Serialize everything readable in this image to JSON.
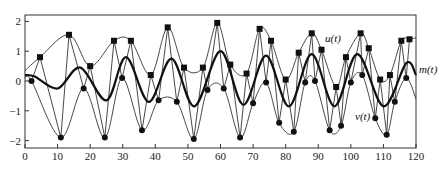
{
  "chart_data": {
    "type": "line",
    "title": "",
    "xlabel": "",
    "ylabel": "",
    "xlim": [
      0,
      120
    ],
    "ylim": [
      -2.3,
      2.2
    ],
    "x_ticks": [
      0,
      10,
      20,
      30,
      40,
      50,
      60,
      70,
      80,
      90,
      100,
      110,
      120
    ],
    "y_ticks": [
      -2,
      -1,
      0,
      1,
      2
    ],
    "grid": false,
    "legend": "inline labels",
    "annotations": [
      {
        "text": "u(t)",
        "x": 92,
        "y": 1.45
      },
      {
        "text": "m(t)",
        "x": 121,
        "y": 0.4
      },
      {
        "text": "v(t)",
        "x": 102,
        "y": -1.2
      }
    ],
    "series": [
      {
        "name": "u(t)",
        "style": "thin line, upper envelope through square markers",
        "marker": "square",
        "x": [
          0,
          4.6,
          13.5,
          20,
          27.3,
          32.5,
          38.6,
          43.8,
          48.8,
          54.6,
          59,
          63,
          68,
          72,
          75.5,
          80,
          84,
          88,
          91,
          95.5,
          98.5,
          103,
          105.5,
          109,
          112,
          115.5,
          118,
          120
        ],
        "y": [
          0.35,
          0.8,
          1.55,
          0.5,
          1.35,
          1.35,
          0.2,
          1.8,
          0.45,
          0.45,
          1.95,
          0.55,
          0.25,
          1.75,
          1.35,
          0.05,
          0.95,
          1.6,
          1.05,
          -0.2,
          0.8,
          1.6,
          1.1,
          0.05,
          0.2,
          1.35,
          1.4,
          1.45
        ]
      },
      {
        "name": "v(t)",
        "style": "thin line, lower envelope through circle markers",
        "marker": "circle",
        "x": [
          0,
          2,
          11,
          18,
          24.5,
          29.8,
          35.9,
          41,
          46.6,
          51.8,
          56,
          61,
          66,
          70,
          74,
          78,
          82.5,
          86,
          89,
          93.5,
          97,
          100,
          103.5,
          107.5,
          111,
          113.5,
          117,
          120
        ],
        "y": [
          0.1,
          0.0,
          -1.9,
          -0.25,
          -1.9,
          0.1,
          -1.65,
          -0.65,
          -0.7,
          -1.95,
          -0.3,
          -0.25,
          -1.9,
          -0.75,
          -0.05,
          -1.4,
          -1.7,
          -0.05,
          0.0,
          -1.65,
          -1.5,
          -0.05,
          0.2,
          -1.25,
          -1.8,
          -0.7,
          0.1,
          -0.6
        ]
      },
      {
        "name": "m(t)",
        "style": "thick line, local mean",
        "marker": "none",
        "x": [
          0,
          3,
          10,
          17,
          25,
          31,
          38,
          45,
          52,
          60,
          67,
          74,
          81,
          88,
          95,
          102,
          110,
          117,
          120
        ],
        "y": [
          0.2,
          0.15,
          -0.25,
          0.45,
          -0.65,
          0.8,
          -0.7,
          0.75,
          -0.85,
          1.0,
          -0.8,
          0.85,
          -0.85,
          0.9,
          -0.85,
          0.9,
          -0.85,
          0.6,
          0.2
        ]
      }
    ],
    "signal_zigzag": {
      "name": "signal extrema polyline",
      "x": [
        2,
        4.6,
        11,
        13.5,
        18,
        20,
        24.5,
        27.3,
        29.8,
        32.5,
        35.9,
        38.6,
        41,
        43.8,
        46.6,
        48.8,
        51.8,
        54.6,
        56,
        59,
        61,
        63,
        66,
        68,
        70,
        72,
        74,
        75.5,
        78,
        80,
        82.5,
        84,
        86,
        88,
        89,
        91,
        93.5,
        95.5,
        97,
        98.5,
        100,
        103,
        103.5,
        105.5,
        107.5,
        109,
        111,
        112,
        113.5,
        115.5,
        117,
        118
      ],
      "kind": [
        "c",
        "s",
        "c",
        "s",
        "c",
        "s",
        "c",
        "s",
        "c",
        "s",
        "c",
        "s",
        "c",
        "s",
        "c",
        "s",
        "c",
        "s",
        "c",
        "s",
        "c",
        "s",
        "c",
        "s",
        "c",
        "s",
        "c",
        "s",
        "c",
        "s",
        "c",
        "s",
        "c",
        "s",
        "c",
        "s",
        "c",
        "s",
        "c",
        "s",
        "c",
        "s",
        "c",
        "s",
        "c",
        "s",
        "c",
        "s",
        "c",
        "s",
        "c",
        "s"
      ]
    }
  },
  "axes": {
    "x_tick_labels": [
      "0",
      "10",
      "20",
      "30",
      "40",
      "50",
      "60",
      "70",
      "80",
      "90",
      "100",
      "110",
      "120"
    ],
    "y_tick_labels": [
      "2",
      "1",
      "0",
      "−1",
      "−2"
    ]
  },
  "labels": {
    "u": "u(t)",
    "m": "m(t)",
    "v": "v(t)"
  }
}
